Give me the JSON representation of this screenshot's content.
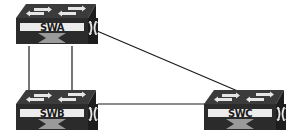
{
  "diagram": {
    "type": "network-topology",
    "colors": {
      "switch_top": "#3a3a3a",
      "switch_front": "#2a2a2a",
      "switch_side": "#1c1c1c",
      "switch_highlight": "#e8e8e8",
      "link": "#1a1a1a",
      "background": "#ffffff"
    },
    "nodes": [
      {
        "id": "SWA",
        "label": "SWA",
        "icon": "switch-icon"
      },
      {
        "id": "SWB",
        "label": "SWB",
        "icon": "switch-icon"
      },
      {
        "id": "SWC",
        "label": "SWC",
        "icon": "switch-icon"
      }
    ],
    "links": [
      {
        "from": "SWA",
        "to": "SWB",
        "name": "link-swa-swb-1"
      },
      {
        "from": "SWA",
        "to": "SWB",
        "name": "link-swa-swb-2"
      },
      {
        "from": "SWA",
        "to": "SWC",
        "name": "link-swa-swc"
      },
      {
        "from": "SWB",
        "to": "SWC",
        "name": "link-swb-swc"
      }
    ]
  }
}
